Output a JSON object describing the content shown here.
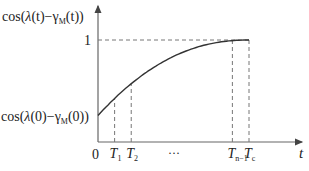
{
  "chart_data": {
    "type": "line",
    "title": "",
    "xlabel": "t",
    "ylabel": "cos(λ(t)−γM(t))",
    "ylabel_parts": {
      "pre": "cos(",
      "lambda": "λ",
      "mid": "(t)−γ",
      "sub": "M",
      "post": "(t))"
    },
    "y0_label_parts": {
      "pre": "cos(",
      "lambda": "λ",
      "mid": "(0)−γ",
      "sub": "M",
      "post": "(0))"
    },
    "y_tick_label": "1",
    "origin_label": "0",
    "x_ticks": [
      {
        "main": "T",
        "sub": "1",
        "x": 0.11
      },
      {
        "main": "T",
        "sub": "2",
        "x": 0.22
      },
      {
        "main": "T",
        "sub": "n−1",
        "x": 0.89
      },
      {
        "main": "T",
        "sub": "c",
        "x": 1.0
      }
    ],
    "ellipsis": "···",
    "curve": {
      "description": "concave increasing curve from cos(λ(0)−γM(0)) at t=0 reaching 1 at t=Tc",
      "y_start": 0.26,
      "y_end": 1.0,
      "x_end": 1.0
    },
    "xlim": [
      0,
      1.35
    ],
    "ylim": [
      0,
      1.0
    ],
    "grid": false,
    "colors": {
      "axis": "#555555",
      "curve": "#333333",
      "dashed": "#666666"
    }
  }
}
